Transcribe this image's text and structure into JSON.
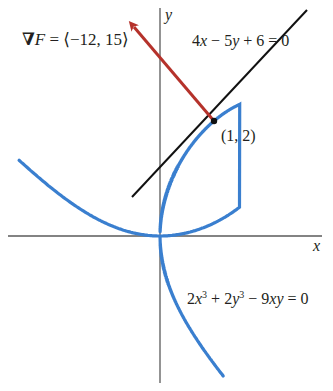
{
  "diagram": {
    "axes": {
      "x_label": "x",
      "y_label": "y",
      "origin_px": [
        160,
        236
      ],
      "scale_px_per_unit": [
        54,
        57.5
      ]
    },
    "curve": {
      "equation_parts": [
        "2",
        "x",
        "3",
        " + 2",
        "y",
        "3",
        " − 9",
        "xy",
        " = 0"
      ],
      "equation_text": "2x³ + 2y³ − 9xy = 0",
      "name": "folium-of-descartes",
      "color": "#3a7fcf"
    },
    "tangent_line": {
      "equation_parts": [
        "4",
        "x",
        " − 5",
        "y",
        " + 6 = 0"
      ],
      "equation_text": "4x − 5y + 6 = 0",
      "color": "#111111"
    },
    "point": {
      "label": "(1, 2)",
      "coords": [
        1,
        2
      ]
    },
    "gradient": {
      "nabla": "∇",
      "var": "F",
      "eq": " = ⟨−12, 15⟩",
      "vector": [
        -12,
        15
      ],
      "color": "#b5322b"
    }
  }
}
